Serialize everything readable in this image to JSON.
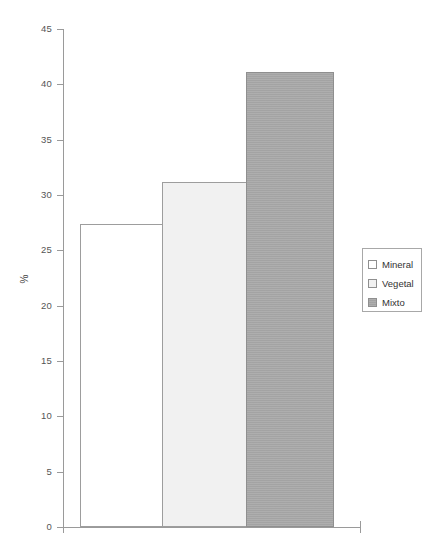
{
  "chart_data": {
    "type": "bar",
    "title": "",
    "subtitle": "",
    "xlabel": "",
    "ylabel": "%",
    "categories": [
      "Mineral",
      "Vegetal",
      "Mixto"
    ],
    "values": [
      27.4,
      31.2,
      41.1
    ],
    "series": [
      {
        "name": "Porcentaje",
        "values": [
          27.4,
          31.2,
          41.1
        ]
      }
    ],
    "ylim": [
      0,
      45
    ],
    "ytick_step": 5,
    "yticks": [
      0,
      5,
      10,
      15,
      20,
      25,
      30,
      35,
      40,
      45
    ],
    "ytick_labels": [
      "0",
      "5",
      "10",
      "15",
      "20",
      "25",
      "30",
      "35",
      "40",
      "45"
    ],
    "xtick_labels": [],
    "grid": false,
    "legend_position": "right",
    "legend": [
      {
        "label": "Mineral",
        "color": "#ffffff"
      },
      {
        "label": "Vegetal",
        "color": "#f1f1f1"
      },
      {
        "label": "Mixto",
        "color": "#a9a9a9"
      }
    ],
    "annotations": [],
    "colors": {
      "axis": "#9a9a9a",
      "tick_text": "#555555",
      "legend_border": "#a8a8a8",
      "bar_border": "#9d9d9d",
      "background": "#ffffff"
    }
  }
}
